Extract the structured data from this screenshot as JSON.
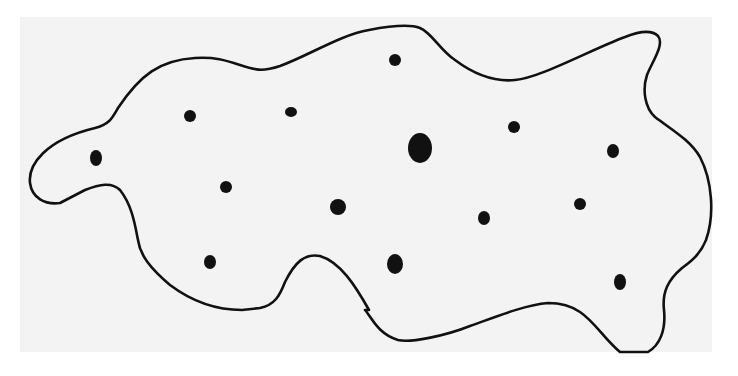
{
  "figure": {
    "type": "blob-with-dots",
    "background": "#ffffff",
    "panel_color": "#f3f3f3",
    "stroke_color": "#111111",
    "dot_color": "#111111",
    "outline_path": "M 30 183 C 28 165 45 140 95 128 C 110 124 112 118 118 108 C 140 75 160 60 195 58 C 215 57 225 60 240 65 C 255 70 262 72 280 66 C 310 55 340 35 369 30 C 390 26 410 24 420 28 C 432 33 440 50 455 60 C 475 75 495 82 515 80 C 540 78 590 50 625 37 C 640 31 652 30 658 36 C 665 44 652 62 647 75 C 642 90 645 108 655 117 C 672 130 690 140 700 157 C 712 180 715 215 706 240 C 700 255 690 262 682 268 C 668 280 662 292 664 310 C 666 330 660 345 648 352 L 620 352 C 605 340 595 322 580 312 C 570 305 560 303 548 303 C 525 305 498 316 470 326 C 445 336 410 343 398 340 C 378 334 372 318 365 310 L 369 310 C 355 285 340 262 320 256 C 305 253 295 262 285 282 C 280 295 275 305 260 308 L 242 310 C 215 310 190 300 170 285 C 150 268 140 255 138 240 C 135 225 132 205 120 190 C 112 182 100 184 85 190 L 60 203 C 45 205 32 198 30 183 Z",
    "dots": [
      {
        "cx": 96,
        "cy": 158,
        "rx": 6,
        "ry": 8,
        "size": "small"
      },
      {
        "cx": 190,
        "cy": 116,
        "rx": 6,
        "ry": 6,
        "size": "small"
      },
      {
        "cx": 291,
        "cy": 112,
        "rx": 6,
        "ry": 5,
        "size": "small"
      },
      {
        "cx": 395,
        "cy": 60,
        "rx": 6,
        "ry": 6,
        "size": "small"
      },
      {
        "cx": 226,
        "cy": 187,
        "rx": 6,
        "ry": 6,
        "size": "small"
      },
      {
        "cx": 420,
        "cy": 148,
        "rx": 12,
        "ry": 15,
        "size": "large"
      },
      {
        "cx": 514,
        "cy": 127,
        "rx": 6,
        "ry": 6,
        "size": "small"
      },
      {
        "cx": 613,
        "cy": 151,
        "rx": 6,
        "ry": 7,
        "size": "small"
      },
      {
        "cx": 338,
        "cy": 207,
        "rx": 8,
        "ry": 8,
        "size": "small"
      },
      {
        "cx": 484,
        "cy": 218,
        "rx": 6,
        "ry": 7,
        "size": "small"
      },
      {
        "cx": 580,
        "cy": 204,
        "rx": 6,
        "ry": 6,
        "size": "small"
      },
      {
        "cx": 210,
        "cy": 262,
        "rx": 6,
        "ry": 7,
        "size": "small"
      },
      {
        "cx": 395,
        "cy": 264,
        "rx": 8,
        "ry": 10,
        "size": "small"
      },
      {
        "cx": 620,
        "cy": 282,
        "rx": 6,
        "ry": 8,
        "size": "small"
      }
    ]
  }
}
